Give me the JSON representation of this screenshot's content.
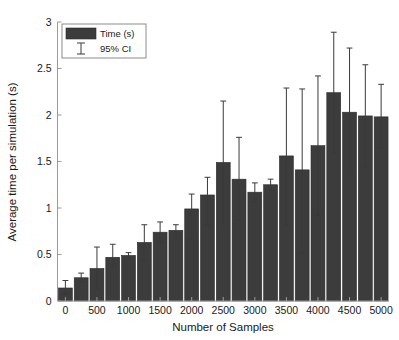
{
  "chart_data": {
    "type": "bar",
    "title": "",
    "xlabel": "Number of Samples",
    "ylabel": "Average time per simulation (s)",
    "xlim": [
      -125,
      5125
    ],
    "ylim": [
      0,
      3
    ],
    "ytick_labels": [
      "0",
      "0.5",
      "1",
      "1.5",
      "2",
      "2.5",
      "3"
    ],
    "ytick_values": [
      0,
      0.5,
      1,
      1.5,
      2,
      2.5,
      3
    ],
    "xtick_labels": [
      "0",
      "500",
      "1000",
      "1500",
      "2000",
      "2500",
      "3000",
      "3500",
      "4000",
      "4500",
      "5000"
    ],
    "xtick_values": [
      0,
      500,
      1000,
      1500,
      2000,
      2500,
      3000,
      3500,
      4000,
      4500,
      5000
    ],
    "grid": false,
    "legend_position": "top-left",
    "legend": [
      {
        "label": "Time (s)",
        "marker": "bar-swatch",
        "color": "#3c3c3c"
      },
      {
        "label": "95% CI",
        "marker": "errorbar",
        "color": "#3a3a3a"
      }
    ],
    "bar_color": "#3c3c3c",
    "errorbar_color": "#3a3a3a",
    "categories": [
      0,
      250,
      500,
      750,
      1000,
      1250,
      1500,
      1750,
      2000,
      2250,
      2500,
      2750,
      3000,
      3250,
      3500,
      3750,
      4000,
      4250,
      4500,
      4750,
      5000
    ],
    "values": [
      0.14,
      0.25,
      0.35,
      0.47,
      0.49,
      0.63,
      0.74,
      0.76,
      0.99,
      1.14,
      1.49,
      1.31,
      1.17,
      1.25,
      1.56,
      1.41,
      1.67,
      2.24,
      2.03,
      1.99,
      1.98
    ],
    "ci_lower": [
      0.07,
      0.2,
      0.13,
      0.36,
      0.46,
      0.44,
      0.63,
      0.66,
      0.66,
      0.82,
      0.83,
      0.87,
      1.06,
      1.19,
      0.82,
      0.52,
      0.92,
      1.59,
      1.36,
      1.44,
      1.65
    ],
    "ci_upper": [
      0.22,
      0.3,
      0.58,
      0.61,
      0.52,
      0.82,
      0.85,
      0.82,
      1.15,
      1.33,
      2.15,
      1.76,
      1.27,
      1.31,
      2.29,
      2.28,
      2.42,
      2.89,
      2.72,
      2.54,
      2.33
    ]
  },
  "figure": {
    "background": "#ffffff"
  }
}
